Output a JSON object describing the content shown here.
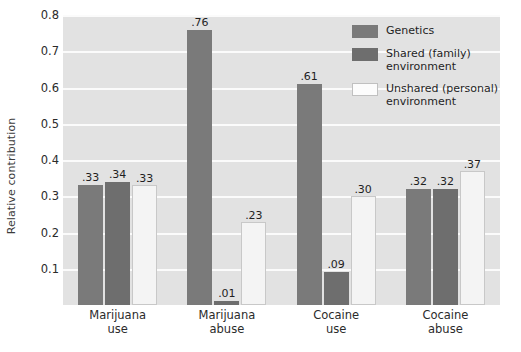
{
  "chart_data": {
    "type": "bar",
    "title": "",
    "xlabel": "",
    "ylabel": "Relative contribution",
    "ylim": [
      0,
      0.8
    ],
    "grid": true,
    "legend_position": "top-right",
    "categories": [
      "Marijuana use",
      "Marijuana abuse",
      "Cocaine use",
      "Cocaine abuse"
    ],
    "category_lines": [
      [
        "Marijuana",
        "use"
      ],
      [
        "Marijuana",
        "abuse"
      ],
      [
        "Cocaine",
        "use"
      ],
      [
        "Cocaine",
        "abuse"
      ]
    ],
    "ytick_labels": [
      "0.8",
      "0.7",
      "0.6",
      "0.5",
      "0.4",
      "0.3",
      "0.2",
      "0.1"
    ],
    "ytick_values": [
      0.8,
      0.7,
      0.6,
      0.5,
      0.4,
      0.3,
      0.2,
      0.1
    ],
    "series": [
      {
        "name": "Genetics",
        "values": [
          0.33,
          0.76,
          0.61,
          0.32
        ],
        "labels": [
          ".33",
          ".76",
          ".61",
          ".32"
        ],
        "color": "#7a7a7a"
      },
      {
        "name": "Shared (family) environment",
        "values": [
          0.34,
          0.01,
          0.09,
          0.32
        ],
        "labels": [
          ".34",
          ".01",
          ".09",
          ".32"
        ],
        "color": "#6e6e6e"
      },
      {
        "name": "Unshared (personal) environment",
        "values": [
          0.33,
          0.23,
          0.3,
          0.37
        ],
        "labels": [
          ".33",
          ".23",
          ".30",
          ".37"
        ],
        "color": "#f4f4f4"
      }
    ]
  },
  "legend": {
    "items": [
      {
        "label": "Genetics",
        "lines": [
          "Genetics"
        ],
        "swatch": "genetics"
      },
      {
        "label": "Shared (family) environment",
        "lines": [
          "Shared (family)",
          "environment"
        ],
        "swatch": "shared"
      },
      {
        "label": "Unshared (personal) environment",
        "lines": [
          "Unshared (personal)",
          "environment"
        ],
        "swatch": "unshared"
      }
    ]
  },
  "colors": {
    "plot_background": "#e2e2e2",
    "gridline": "#fbfbfb",
    "genetics": "#7a7a7a",
    "shared": "#6e6e6e",
    "unshared": "#f4f4f4",
    "page_background": "#ffffff"
  }
}
